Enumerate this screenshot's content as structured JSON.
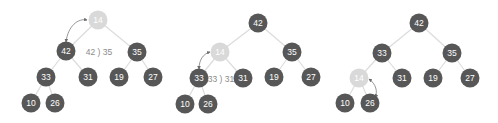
{
  "diagram": {
    "colors": {
      "node_dark": "#575757",
      "node_highlight": "#d9d9d9",
      "edge": "#dcdcdc",
      "label": "#8a8a8a"
    },
    "panels": [
      {
        "step": 1,
        "comparison_label": "42 ) 35",
        "nodes": [
          {
            "id": "p1n0",
            "value": "14",
            "x": 98,
            "y": 20,
            "highlight": true
          },
          {
            "id": "p1n1",
            "value": "42",
            "x": 66,
            "y": 51,
            "highlight": false
          },
          {
            "id": "p1n2",
            "value": "35",
            "x": 137,
            "y": 52,
            "highlight": false
          },
          {
            "id": "p1n3",
            "value": "33",
            "x": 46,
            "y": 77,
            "highlight": false
          },
          {
            "id": "p1n4",
            "value": "31",
            "x": 88,
            "y": 77,
            "highlight": false
          },
          {
            "id": "p1n5",
            "value": "19",
            "x": 119,
            "y": 77,
            "highlight": false
          },
          {
            "id": "p1n6",
            "value": "27",
            "x": 153,
            "y": 77,
            "highlight": false
          },
          {
            "id": "p1n7",
            "value": "10",
            "x": 31,
            "y": 103,
            "highlight": false
          },
          {
            "id": "p1n8",
            "value": "26",
            "x": 55,
            "y": 103,
            "highlight": false
          }
        ]
      },
      {
        "step": 2,
        "comparison_label": "33 ) 31",
        "nodes": [
          {
            "id": "p2n0",
            "value": "42",
            "x": 258,
            "y": 23,
            "highlight": false
          },
          {
            "id": "p2n1",
            "value": "14",
            "x": 220,
            "y": 52,
            "highlight": true
          },
          {
            "id": "p2n2",
            "value": "35",
            "x": 292,
            "y": 52,
            "highlight": false
          },
          {
            "id": "p2n3",
            "value": "33",
            "x": 199,
            "y": 78,
            "highlight": false
          },
          {
            "id": "p2n4",
            "value": "31",
            "x": 243,
            "y": 78,
            "highlight": false
          },
          {
            "id": "p2n5",
            "value": "19",
            "x": 274,
            "y": 77,
            "highlight": false
          },
          {
            "id": "p2n6",
            "value": "27",
            "x": 311,
            "y": 77,
            "highlight": false
          },
          {
            "id": "p2n7",
            "value": "10",
            "x": 185,
            "y": 104,
            "highlight": false
          },
          {
            "id": "p2n8",
            "value": "26",
            "x": 208,
            "y": 104,
            "highlight": false
          }
        ]
      },
      {
        "step": 3,
        "comparison_label": "",
        "nodes": [
          {
            "id": "p3n0",
            "value": "42",
            "x": 419,
            "y": 23,
            "highlight": false
          },
          {
            "id": "p3n1",
            "value": "33",
            "x": 382,
            "y": 53,
            "highlight": false
          },
          {
            "id": "p3n2",
            "value": "35",
            "x": 452,
            "y": 53,
            "highlight": false
          },
          {
            "id": "p3n3",
            "value": "14",
            "x": 359,
            "y": 78,
            "highlight": true
          },
          {
            "id": "p3n4",
            "value": "31",
            "x": 402,
            "y": 78,
            "highlight": false
          },
          {
            "id": "p3n5",
            "value": "19",
            "x": 433,
            "y": 78,
            "highlight": false
          },
          {
            "id": "p3n6",
            "value": "27",
            "x": 470,
            "y": 78,
            "highlight": false
          },
          {
            "id": "p3n7",
            "value": "10",
            "x": 345,
            "y": 103,
            "highlight": false
          },
          {
            "id": "p3n8",
            "value": "26",
            "x": 370,
            "y": 103,
            "highlight": false
          }
        ]
      }
    ]
  }
}
